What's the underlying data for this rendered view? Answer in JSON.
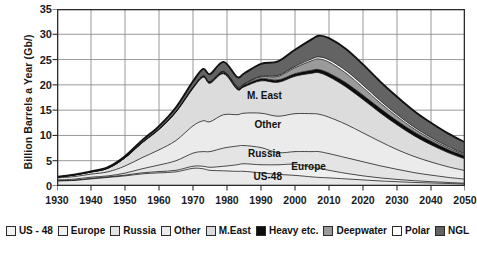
{
  "chart_data": {
    "type": "area",
    "stacked": true,
    "title": "",
    "xlabel": "",
    "ylabel": "Billion Barrels a Year (Gb/)",
    "xlim": [
      1930,
      2050
    ],
    "ylim": [
      0,
      35
    ],
    "yticks": [
      0,
      5,
      10,
      15,
      20,
      25,
      30,
      35
    ],
    "xticks": [
      1930,
      1940,
      1950,
      1960,
      1970,
      1980,
      1990,
      2000,
      2010,
      2020,
      2030,
      2040,
      2050
    ],
    "grid": true,
    "legend_position": "bottom",
    "x": [
      1930,
      1935,
      1940,
      1945,
      1950,
      1955,
      1960,
      1965,
      1970,
      1973,
      1975,
      1979,
      1983,
      1985,
      1990,
      1995,
      2000,
      2005,
      2007,
      2010,
      2015,
      2020,
      2025,
      2030,
      2035,
      2040,
      2045,
      2050
    ],
    "series": [
      {
        "name": "US - 48",
        "color": "#e9e9e9",
        "values": [
          1.0,
          1.1,
          1.4,
          1.7,
          2.0,
          2.4,
          2.6,
          2.8,
          3.5,
          3.4,
          3.1,
          3.0,
          2.9,
          2.9,
          2.6,
          2.3,
          2.1,
          1.8,
          1.7,
          1.6,
          1.4,
          1.2,
          1.0,
          0.85,
          0.7,
          0.6,
          0.5,
          0.4
        ]
      },
      {
        "name": "Europe",
        "color": "#efefef",
        "values": [
          0.05,
          0.05,
          0.1,
          0.1,
          0.15,
          0.2,
          0.25,
          0.3,
          0.4,
          0.5,
          0.6,
          0.9,
          1.3,
          1.5,
          1.6,
          1.9,
          2.2,
          1.9,
          1.8,
          1.5,
          1.1,
          0.8,
          0.6,
          0.45,
          0.35,
          0.25,
          0.2,
          0.15
        ]
      },
      {
        "name": "Russia",
        "color": "#e4e4e4",
        "values": [
          0.15,
          0.2,
          0.25,
          0.2,
          0.4,
          0.8,
          1.3,
          1.9,
          2.6,
          2.9,
          3.1,
          3.6,
          3.7,
          3.6,
          3.4,
          2.4,
          2.5,
          3.1,
          3.3,
          3.3,
          3.1,
          2.8,
          2.4,
          2.0,
          1.6,
          1.3,
          1.0,
          0.8
        ]
      },
      {
        "name": "Other",
        "color": "#ebebeb",
        "values": [
          0.4,
          0.5,
          0.6,
          0.8,
          1.4,
          2.2,
          3.0,
          4.0,
          5.4,
          6.1,
          5.9,
          6.6,
          6.2,
          6.4,
          6.8,
          7.2,
          7.5,
          7.5,
          7.4,
          7.2,
          6.6,
          5.7,
          4.8,
          3.9,
          3.2,
          2.6,
          2.1,
          1.7
        ]
      },
      {
        "name": "M.East",
        "color": "#dcdcdc",
        "values": [
          0.15,
          0.3,
          0.4,
          0.7,
          1.6,
          2.9,
          4.0,
          5.6,
          7.4,
          8.6,
          7.6,
          8.1,
          5.0,
          5.2,
          6.4,
          6.7,
          7.4,
          8.0,
          8.2,
          8.0,
          7.4,
          6.6,
          5.7,
          4.9,
          4.1,
          3.4,
          2.8,
          2.3
        ]
      },
      {
        "name": "Heavy etc.",
        "color": "#0d0d0d",
        "values": [
          0.02,
          0.02,
          0.03,
          0.04,
          0.05,
          0.07,
          0.1,
          0.12,
          0.18,
          0.2,
          0.22,
          0.3,
          0.32,
          0.35,
          0.4,
          0.45,
          0.5,
          0.6,
          0.62,
          0.7,
          0.8,
          0.85,
          0.85,
          0.8,
          0.75,
          0.7,
          0.6,
          0.55
        ]
      },
      {
        "name": "Deepwater",
        "color": "#9a9a9a",
        "values": [
          0.0,
          0.0,
          0.0,
          0.0,
          0.0,
          0.0,
          0.0,
          0.0,
          0.02,
          0.03,
          0.05,
          0.1,
          0.15,
          0.2,
          0.4,
          0.7,
          1.2,
          1.9,
          2.1,
          2.2,
          1.9,
          1.5,
          1.1,
          0.85,
          0.6,
          0.45,
          0.35,
          0.25
        ]
      },
      {
        "name": "Polar",
        "color": "#ffffff",
        "values": [
          0.0,
          0.0,
          0.0,
          0.0,
          0.0,
          0.0,
          0.0,
          0.0,
          0.0,
          0.02,
          0.03,
          0.05,
          0.08,
          0.1,
          0.15,
          0.2,
          0.25,
          0.35,
          0.4,
          0.45,
          0.5,
          0.5,
          0.45,
          0.4,
          0.35,
          0.3,
          0.25,
          0.2
        ]
      },
      {
        "name": "NGL",
        "color": "#636363",
        "values": [
          0.05,
          0.08,
          0.12,
          0.2,
          0.3,
          0.45,
          0.6,
          0.85,
          1.2,
          1.4,
          1.5,
          1.9,
          1.9,
          2.0,
          2.4,
          2.8,
          3.3,
          3.9,
          4.2,
          4.3,
          4.3,
          4.1,
          3.8,
          3.5,
          3.2,
          2.9,
          2.6,
          2.3
        ]
      }
    ],
    "annotations": [
      {
        "text": "M. East",
        "x": 1991,
        "y": 18.0
      },
      {
        "text": "Other",
        "x": 1992,
        "y": 12.2
      },
      {
        "text": "Russia",
        "x": 1991,
        "y": 6.6
      },
      {
        "text": "Europe",
        "x": 2004,
        "y": 4.0
      },
      {
        "text": "US-48",
        "x": 1992,
        "y": 2.0
      }
    ],
    "legend": [
      {
        "label": "US - 48",
        "color": "#f2f2f2"
      },
      {
        "label": "Europe",
        "color": "#efefef"
      },
      {
        "label": "Russia",
        "color": "#e4e4e4"
      },
      {
        "label": "Other",
        "color": "#ebebeb"
      },
      {
        "label": "M.East",
        "color": "#dcdcdc"
      },
      {
        "label": "Heavy etc.",
        "color": "#0d0d0d"
      },
      {
        "label": "Deepwater",
        "color": "#9a9a9a"
      },
      {
        "label": "Polar",
        "color": "#ffffff"
      },
      {
        "label": "NGL",
        "color": "#636363"
      }
    ],
    "style": {
      "grid_color": "#8c8c8c",
      "axis_color": "#2b2b2b",
      "series_line_color": "#111111",
      "plot_background": "#ffffff"
    }
  }
}
